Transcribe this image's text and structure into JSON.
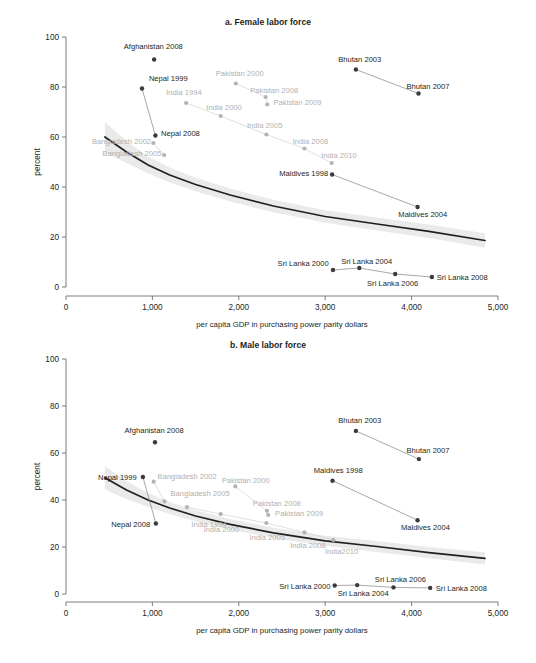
{
  "figure": {
    "panels": [
      "a. Female labor force",
      "b. Male labor force"
    ]
  },
  "axes": {
    "x_title": "per capita GDP in purchasing power parity dollars",
    "y_title": "percent",
    "x_ticks": [
      "0",
      "1,000",
      "2,000",
      "3,000",
      "4,000",
      "5,000"
    ],
    "y_ticks": [
      "0",
      "20",
      "40",
      "60",
      "80",
      "100"
    ],
    "x_min": 0,
    "x_max": 5000,
    "y_min": 0,
    "y_max": 100
  },
  "colors": {
    "dark_marker": "#3b3b3b",
    "light_marker": "#b3b3b3",
    "dark_label": "#231f20",
    "light_label": "#b0b0b0",
    "trend_line": "#231f20",
    "confidence_band": "#d9d9d9",
    "axis": "#6d6e71"
  },
  "chart_data": [
    {
      "type": "scatter",
      "panel": "a",
      "title": "a. Female labor force",
      "xlabel": "per capita GDP in purchasing power parity dollars",
      "ylabel": "percent",
      "xlim": [
        0,
        5000
      ],
      "ylim": [
        0,
        100
      ],
      "grid": false,
      "legend": "none",
      "trend_line": {
        "x": [
          450,
          700,
          950,
          1200,
          1500,
          1900,
          2400,
          3000,
          3600,
          4200,
          4850
        ],
        "y": [
          60.0,
          54.0,
          48.8,
          44.8,
          41.0,
          36.8,
          32.4,
          28.2,
          25.2,
          22.3,
          18.6
        ],
        "band_half_width": [
          6.0,
          4.4,
          3.4,
          3.0,
          2.7,
          2.6,
          2.5,
          2.5,
          2.6,
          2.7,
          2.9
        ]
      },
      "series": [
        {
          "name": "Afghanistan",
          "tone": "dark",
          "points": [
            {
              "label": "Afghanistan 2008",
              "x": 1020,
              "y": 91.0,
              "lx": 1010,
              "ly": 96.5,
              "anchor": "middle"
            }
          ]
        },
        {
          "name": "Nepal",
          "tone": "dark",
          "points": [
            {
              "label": "Nepal 1999",
              "x": 880,
              "y": 79.4,
              "lx": 960,
              "ly": 83.5,
              "anchor": "start"
            },
            {
              "label": "Nepal 2008",
              "x": 1035,
              "y": 60.6,
              "lx": 1100,
              "ly": 61.8,
              "anchor": "start"
            }
          ]
        },
        {
          "name": "Bangladesh",
          "tone": "light",
          "points": [
            {
              "label": "Bangladesh 2002",
              "x": 1010,
              "y": 57.6,
              "lx": 985,
              "ly": 58.6,
              "anchor": "end"
            },
            {
              "label": "Bangladesh 2005",
              "x": 1135,
              "y": 52.8,
              "lx": 1105,
              "ly": 53.8,
              "anchor": "end"
            }
          ]
        },
        {
          "name": "India",
          "tone": "light",
          "points": [
            {
              "label": "India 1994",
              "x": 1390,
              "y": 73.6,
              "lx": 1365,
              "ly": 78.0,
              "anchor": "middle"
            },
            {
              "label": "India 2000",
              "x": 1790,
              "y": 68.4,
              "lx": 1830,
              "ly": 72.0,
              "anchor": "middle"
            },
            {
              "label": "India 2005",
              "x": 2320,
              "y": 61.0,
              "lx": 2300,
              "ly": 65.0,
              "anchor": "middle"
            },
            {
              "label": "India 2008",
              "x": 2760,
              "y": 55.4,
              "lx": 2830,
              "ly": 58.5,
              "anchor": "middle"
            },
            {
              "label": "India 2010",
              "x": 3075,
              "y": 49.6,
              "lx": 3160,
              "ly": 53.0,
              "anchor": "middle"
            }
          ]
        },
        {
          "name": "Pakistan",
          "tone": "light",
          "points": [
            {
              "label": "Pakistan 2000",
              "x": 1965,
              "y": 81.4,
              "lx": 2010,
              "ly": 85.6,
              "anchor": "middle"
            },
            {
              "label": "Pakistan 2008",
              "x": 2310,
              "y": 76.0,
              "lx": 2410,
              "ly": 79.0,
              "anchor": "middle"
            },
            {
              "label": "Pakistan 2009",
              "x": 2330,
              "y": 73.0,
              "lx": 2400,
              "ly": 74.2,
              "anchor": "start"
            }
          ]
        },
        {
          "name": "Bhutan",
          "tone": "dark",
          "points": [
            {
              "label": "Bhutan 2003",
              "x": 3355,
              "y": 87.0,
              "lx": 3400,
              "ly": 91.4,
              "anchor": "middle"
            },
            {
              "label": "Bhutan 2007",
              "x": 4080,
              "y": 77.4,
              "lx": 4190,
              "ly": 80.6,
              "anchor": "middle"
            }
          ]
        },
        {
          "name": "Maldives",
          "tone": "dark",
          "points": [
            {
              "label": "Maldives 1998",
              "x": 3080,
              "y": 45.0,
              "lx": 3035,
              "ly": 45.6,
              "anchor": "end"
            },
            {
              "label": "Maldives 2004",
              "x": 4070,
              "y": 32.0,
              "lx": 4130,
              "ly": 29.4,
              "anchor": "middle"
            }
          ]
        },
        {
          "name": "Sri Lanka",
          "tone": "dark",
          "points": [
            {
              "label": "Sri Lanka 2000",
              "x": 3090,
              "y": 6.8,
              "lx": 3040,
              "ly": 9.6,
              "anchor": "end"
            },
            {
              "label": "Sri Lanka 2004",
              "x": 3395,
              "y": 7.6,
              "lx": 3480,
              "ly": 10.4,
              "anchor": "middle"
            },
            {
              "label": "Sri Lanka 2006",
              "x": 3810,
              "y": 5.2,
              "lx": 3780,
              "ly": 1.8,
              "anchor": "middle"
            },
            {
              "label": "Sri Lanka  2008",
              "x": 4235,
              "y": 4.0,
              "lx": 4290,
              "ly": 4.0,
              "anchor": "start"
            }
          ]
        }
      ]
    },
    {
      "type": "scatter",
      "panel": "b",
      "title": "b. Male labor force",
      "xlabel": "per capita GDP in purchasing power parity dollars",
      "ylabel": "percent",
      "xlim": [
        0,
        5000
      ],
      "ylim": [
        0,
        100
      ],
      "grid": false,
      "legend": "none",
      "trend_line": {
        "x": [
          450,
          700,
          950,
          1200,
          1500,
          1900,
          2400,
          3000,
          3600,
          4200,
          4850
        ],
        "y": [
          49.5,
          44.2,
          40.0,
          36.6,
          33.2,
          29.6,
          26.0,
          22.6,
          20.2,
          17.6,
          15.2
        ],
        "band_half_width": [
          5.0,
          3.8,
          3.0,
          2.6,
          2.4,
          2.3,
          2.2,
          2.2,
          2.3,
          2.4,
          2.6
        ]
      },
      "series": [
        {
          "name": "Afghanistan",
          "tone": "dark",
          "points": [
            {
              "label": "Afghanistan 2008",
              "x": 1030,
              "y": 64.6,
              "lx": 1020,
              "ly": 69.8,
              "anchor": "middle"
            }
          ]
        },
        {
          "name": "Nepal",
          "tone": "dark",
          "points": [
            {
              "label": "Nepal 1999",
              "x": 890,
              "y": 49.8,
              "lx": 820,
              "ly": 49.8,
              "anchor": "end"
            },
            {
              "label": "Nepal 2008",
              "x": 1040,
              "y": 30.0,
              "lx": 975,
              "ly": 30.0,
              "anchor": "end"
            }
          ]
        },
        {
          "name": "Bangladesh",
          "tone": "light",
          "points": [
            {
              "label": "Bangladesh 2002",
              "x": 1015,
              "y": 47.8,
              "lx": 1060,
              "ly": 50.4,
              "anchor": "start"
            },
            {
              "label": "Bangladesh 2005",
              "x": 1140,
              "y": 39.4,
              "lx": 1210,
              "ly": 43.2,
              "anchor": "start"
            }
          ]
        },
        {
          "name": "India",
          "tone": "light",
          "points": [
            {
              "label": "India 1994",
              "x": 1400,
              "y": 37.0,
              "lx": 1450,
              "ly": 30.0,
              "anchor": "start"
            },
            {
              "label": "India 2000",
              "x": 1790,
              "y": 34.0,
              "lx": 1800,
              "ly": 27.8,
              "anchor": "middle"
            },
            {
              "label": "India 2005",
              "x": 2320,
              "y": 30.2,
              "lx": 2330,
              "ly": 24.4,
              "anchor": "middle"
            },
            {
              "label": "India 2008",
              "x": 2760,
              "y": 26.2,
              "lx": 2800,
              "ly": 21.0,
              "anchor": "middle"
            },
            {
              "label": "India2010",
              "x": 3095,
              "y": 23.0,
              "lx": 3190,
              "ly": 18.2,
              "anchor": "middle"
            }
          ]
        },
        {
          "name": "Pakistan",
          "tone": "light",
          "points": [
            {
              "label": "Pakistan 2000",
              "x": 1960,
              "y": 45.8,
              "lx": 2080,
              "ly": 48.6,
              "anchor": "middle"
            },
            {
              "label": "Pakistan 2008",
              "x": 2325,
              "y": 35.4,
              "lx": 2440,
              "ly": 38.6,
              "anchor": "middle"
            },
            {
              "label": "Pakistan 2009",
              "x": 2340,
              "y": 33.6,
              "lx": 2420,
              "ly": 34.6,
              "anchor": "start"
            }
          ]
        },
        {
          "name": "Bhutan",
          "tone": "dark",
          "points": [
            {
              "label": "Bhutan 2003",
              "x": 3355,
              "y": 69.4,
              "lx": 3400,
              "ly": 74.0,
              "anchor": "middle"
            },
            {
              "label": "Bhutan 2007",
              "x": 4085,
              "y": 57.4,
              "lx": 4190,
              "ly": 61.4,
              "anchor": "middle"
            }
          ]
        },
        {
          "name": "Maldives",
          "tone": "dark",
          "points": [
            {
              "label": "Maldives 1998",
              "x": 3085,
              "y": 48.2,
              "lx": 3150,
              "ly": 52.8,
              "anchor": "middle"
            },
            {
              "label": "Maldives 2004",
              "x": 4070,
              "y": 31.4,
              "lx": 4160,
              "ly": 28.4,
              "anchor": "middle"
            }
          ]
        },
        {
          "name": "Sri Lanka",
          "tone": "dark",
          "points": [
            {
              "label": "Sri Lanka 2000",
              "x": 3110,
              "y": 3.6,
              "lx": 3060,
              "ly": 3.4,
              "anchor": "end"
            },
            {
              "label": "Sri Lanka 2004",
              "x": 3370,
              "y": 3.8,
              "lx": 3440,
              "ly": 0.4,
              "anchor": "middle"
            },
            {
              "label": "Sri Lanka 2006",
              "x": 3790,
              "y": 2.8,
              "lx": 3870,
              "ly": 6.4,
              "anchor": "middle"
            },
            {
              "label": "Sri Lanka 2008",
              "x": 4215,
              "y": 2.6,
              "lx": 4280,
              "ly": 2.6,
              "anchor": "start"
            }
          ]
        }
      ]
    }
  ]
}
